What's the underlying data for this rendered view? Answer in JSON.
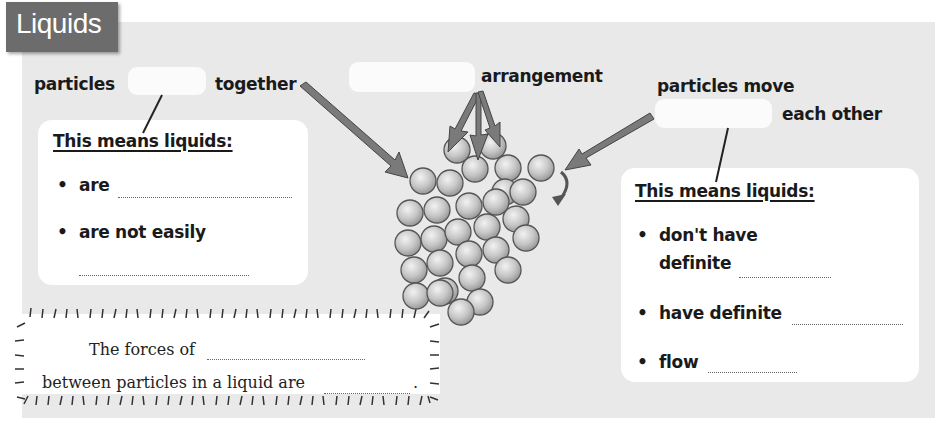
{
  "title": "Liquids",
  "labels": {
    "together_prefix": "particles",
    "together_suffix": "together",
    "arrangement_suffix": "arrangement",
    "move_prefix": "particles move",
    "move_suffix": "each other"
  },
  "left_card": {
    "heading": "This means liquids:",
    "bullets": [
      {
        "text": "are"
      },
      {
        "text": "are not easily"
      }
    ]
  },
  "right_card": {
    "heading": "This means liquids:",
    "bullets": [
      {
        "text": "don't have",
        "text2": "definite"
      },
      {
        "text": "have definite"
      },
      {
        "text": "flow"
      }
    ]
  },
  "forces_box": {
    "line1": "The forces of",
    "line2": "between particles in a liquid are",
    "line2_end": "."
  },
  "colors": {
    "panel_bg": "#e9e9e9",
    "title_bg": "#6c6c6c",
    "arrow": "#777777",
    "particle": "#c8c8c8"
  }
}
